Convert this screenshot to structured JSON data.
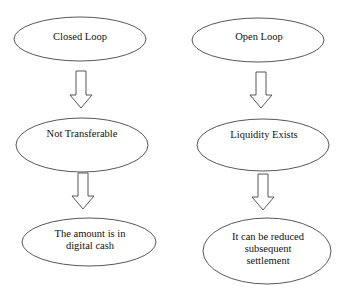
{
  "diagram": {
    "colors": {
      "stroke": "#444444",
      "text": "#111111",
      "background": "#ffffff"
    },
    "columns": [
      {
        "name": "closed-loop",
        "nodes": [
          {
            "label": "Closed Loop"
          },
          {
            "label": "Not Transferable"
          },
          {
            "label": "The amount is in digital cash"
          }
        ]
      },
      {
        "name": "open-loop",
        "nodes": [
          {
            "label": "Open Loop"
          },
          {
            "label": "Liquidity Exists"
          },
          {
            "label": "It can be reduced subsequent settlement"
          }
        ]
      }
    ],
    "edges": [
      {
        "from": "Closed Loop",
        "to": "Not Transferable"
      },
      {
        "from": "Not Transferable",
        "to": "The amount is in digital cash"
      },
      {
        "from": "Open Loop",
        "to": "Liquidity Exists"
      },
      {
        "from": "Liquidity Exists",
        "to": "It can be reduced subsequent settlement"
      }
    ]
  }
}
